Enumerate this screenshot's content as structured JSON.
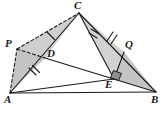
{
  "figure": {
    "type": "geometry-diagram",
    "background_color": "#ffffff",
    "stroke_color": "#1a1a1a",
    "shade_color": "#c9c9c9",
    "points": [
      {
        "id": "A",
        "label": "A",
        "x": 10,
        "y": 93,
        "label_x": 5,
        "label_y": 96
      },
      {
        "id": "B",
        "label": "B",
        "x": 156,
        "y": 92,
        "label_x": 150,
        "label_y": 96
      },
      {
        "id": "C",
        "label": "C",
        "x": 79,
        "y": 13,
        "label_x": 74,
        "label_y": 1
      },
      {
        "id": "P",
        "label": "P",
        "x": 17,
        "y": 49,
        "label_x": 7,
        "label_y": 40
      },
      {
        "id": "D",
        "label": "D",
        "x": 45,
        "y": 58,
        "label_x": 48,
        "label_y": 50
      },
      {
        "id": "Q",
        "label": "Q",
        "x": 124,
        "y": 52,
        "label_x": 126,
        "label_y": 41
      },
      {
        "id": "E",
        "label": "E",
        "x": 114,
        "y": 79,
        "label_x": 106,
        "label_y": 81
      }
    ],
    "segments": [
      {
        "name": "segment-A-B",
        "from": "A",
        "to": "B",
        "style": "solid"
      },
      {
        "name": "segment-A-C",
        "from": "A",
        "to": "C",
        "style": "solid"
      },
      {
        "name": "segment-C-B",
        "from": "C",
        "to": "B",
        "style": "solid"
      },
      {
        "name": "segment-D-B",
        "from": "D",
        "to": "B",
        "style": "solid"
      },
      {
        "name": "segment-C-E",
        "from": "C",
        "to": "E",
        "style": "solid"
      },
      {
        "name": "segment-A-E",
        "from": "A",
        "to": "E",
        "style": "solid"
      },
      {
        "name": "segment-Q-E",
        "from": "Q",
        "to": "E",
        "style": "solid"
      },
      {
        "name": "segment-A-P",
        "from": "A",
        "to": "P",
        "style": "dashed"
      },
      {
        "name": "segment-P-D",
        "from": "P",
        "to": "D",
        "style": "dashed"
      },
      {
        "name": "segment-P-C",
        "from": "P",
        "to": "C",
        "style": "dashed"
      }
    ],
    "shaded_regions": [
      {
        "name": "shaded-triangle-APD",
        "vertices": [
          "A",
          "P",
          "D"
        ]
      },
      {
        "name": "shaded-triangle-PDC",
        "vertices": [
          "P",
          "D",
          "C"
        ]
      },
      {
        "name": "shaded-triangle-QEB",
        "vertices": [
          "Q",
          "E",
          "B"
        ]
      },
      {
        "name": "shaded-triangle-CQE",
        "vertices": [
          "C",
          "Q",
          "E"
        ]
      }
    ],
    "tick_marks": [
      {
        "name": "tick-segment-CD-upper",
        "segment": "C-D",
        "count": 1,
        "t": 0.48
      },
      {
        "name": "tick-segment-AD-lower",
        "segment": "A-D",
        "count": 2,
        "t": 0.62
      },
      {
        "name": "tick-segment-CE",
        "segment": "C-E",
        "count": 2,
        "t": 0.42
      },
      {
        "name": "tick-segment-CQ",
        "segment": "C-Q",
        "count": 2,
        "t": 0.7
      }
    ],
    "right_angle": {
      "name": "right-angle-marker-E",
      "at": "E",
      "size": 8,
      "filled": true
    }
  }
}
